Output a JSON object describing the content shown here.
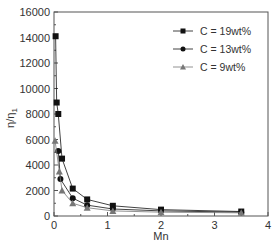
{
  "chart_data": {
    "type": "line",
    "title": "",
    "xlabel": "Mn",
    "ylabel": "η/η1",
    "xlim": [
      0,
      4
    ],
    "ylim": [
      0,
      16000
    ],
    "xticks": [
      0,
      1,
      2,
      3,
      4
    ],
    "yticks": [
      0,
      2000,
      4000,
      6000,
      8000,
      10000,
      12000,
      14000,
      16000
    ],
    "grid": false,
    "legend_position": "upper right",
    "series": [
      {
        "name": "C = 19wt%",
        "marker": "square",
        "color": "#111111",
        "x": [
          0.03,
          0.05,
          0.08,
          0.15,
          0.35,
          0.62,
          1.1,
          2.0,
          3.5
        ],
        "y": [
          14100,
          8900,
          8000,
          4500,
          2150,
          1300,
          800,
          500,
          350
        ]
      },
      {
        "name": "C = 13wt%",
        "marker": "circle",
        "color": "#111111",
        "x": [
          0.08,
          0.12,
          0.35,
          0.62,
          1.1,
          2.0,
          3.5
        ],
        "y": [
          5100,
          2900,
          1400,
          850,
          550,
          400,
          300
        ]
      },
      {
        "name": "C = 9wt%",
        "marker": "triangle",
        "color": "#777777",
        "x": [
          0.02,
          0.1,
          0.15,
          0.35,
          0.62,
          1.1,
          2.0,
          3.5
        ],
        "y": [
          5900,
          3500,
          2000,
          1000,
          650,
          400,
          300,
          250
        ]
      }
    ]
  },
  "axes": {
    "x_title": "Mn",
    "y_title_main": "η/η",
    "y_title_sub": "1"
  },
  "legend": {
    "items": [
      {
        "label": "C = 19wt%"
      },
      {
        "label": "C = 13wt%"
      },
      {
        "label": "C = 9wt%"
      }
    ]
  }
}
